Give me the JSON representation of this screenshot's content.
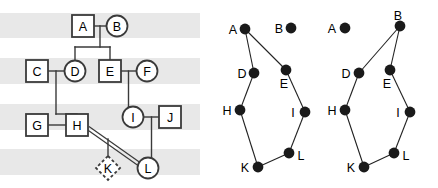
{
  "figure": {
    "panels": [
      "pedigree",
      "graph-middle",
      "graph-right"
    ]
  },
  "colors": {
    "band": "#e8e8e8",
    "background": "#ffffff",
    "stroke": "#3a3a3a",
    "node_fill": "#1a1a1a",
    "shape_fill": "#ffffff",
    "label": "#000000"
  },
  "pedigree": {
    "bands": [
      {
        "name": "generation-band-1",
        "y": 13,
        "height": 25
      },
      {
        "name": "generation-band-2",
        "y": 58,
        "height": 26
      },
      {
        "name": "generation-band-3",
        "y": 104,
        "height": 26
      },
      {
        "name": "generation-band-4",
        "y": 149,
        "height": 26
      }
    ],
    "individuals": [
      {
        "id": "A",
        "label": "A",
        "shape": "square",
        "x": 83,
        "y": 26
      },
      {
        "id": "B",
        "label": "B",
        "shape": "circle",
        "x": 117,
        "y": 26
      },
      {
        "id": "C",
        "label": "C",
        "shape": "square",
        "x": 37,
        "y": 71
      },
      {
        "id": "D",
        "label": "D",
        "shape": "circle",
        "x": 75,
        "y": 71
      },
      {
        "id": "E",
        "label": "E",
        "shape": "square",
        "x": 110,
        "y": 71
      },
      {
        "id": "F",
        "label": "F",
        "shape": "circle",
        "x": 147,
        "y": 71
      },
      {
        "id": "G",
        "label": "G",
        "shape": "square",
        "x": 37,
        "y": 125
      },
      {
        "id": "H",
        "label": "H",
        "shape": "square",
        "x": 77,
        "y": 125
      },
      {
        "id": "I",
        "label": "I",
        "shape": "circle",
        "x": 133,
        "y": 117
      },
      {
        "id": "J",
        "label": "J",
        "shape": "square",
        "x": 170,
        "y": 117
      },
      {
        "id": "K",
        "label": "K",
        "shape": "diamond-dashed",
        "x": 108,
        "y": 168
      },
      {
        "id": "L",
        "label": "L",
        "shape": "circle",
        "x": 148,
        "y": 168
      }
    ],
    "relationships": [
      {
        "name": "mating-A-B",
        "type": "mating",
        "from": "A",
        "to": "B"
      },
      {
        "name": "mating-C-D",
        "type": "mating",
        "from": "C",
        "to": "D"
      },
      {
        "name": "mating-E-F",
        "type": "mating",
        "from": "E",
        "to": "F"
      },
      {
        "name": "mating-G-H",
        "type": "mating",
        "from": "G",
        "to": "H"
      },
      {
        "name": "mating-I-J",
        "type": "mating",
        "from": "I",
        "to": "J"
      },
      {
        "name": "mating-H-L-consanguineous",
        "type": "consanguineous",
        "from": "H",
        "to": "L"
      },
      {
        "name": "descent-AB-to-D",
        "type": "descent",
        "from": "A-B",
        "to": "D"
      },
      {
        "name": "descent-AB-to-E",
        "type": "descent",
        "from": "A-B",
        "to": "E"
      },
      {
        "name": "descent-CD-to-H",
        "type": "descent",
        "from": "C-D",
        "to": "H"
      },
      {
        "name": "descent-EF-to-I",
        "type": "descent",
        "from": "E-F",
        "to": "I"
      },
      {
        "name": "descent-IJ-to-L",
        "type": "descent",
        "from": "I-J",
        "to": "L"
      },
      {
        "name": "descent-HL-to-K",
        "type": "descent",
        "from": "H-L",
        "to": "K"
      }
    ]
  },
  "graph_middle": {
    "caption": "",
    "nodes": [
      {
        "id": "A",
        "label": "A",
        "x": 45,
        "y": 29,
        "label_dx": -12,
        "label_dy": 1
      },
      {
        "id": "B",
        "label": "B",
        "x": 91,
        "y": 28,
        "label_dx": -12,
        "label_dy": 1
      },
      {
        "id": "D",
        "label": "D",
        "x": 54,
        "y": 73,
        "label_dx": -12,
        "label_dy": 1
      },
      {
        "id": "E",
        "label": "E",
        "x": 86,
        "y": 70,
        "label_dx": -2,
        "label_dy": 14
      },
      {
        "id": "H",
        "label": "H",
        "x": 40,
        "y": 110,
        "label_dx": -13,
        "label_dy": 1
      },
      {
        "id": "I",
        "label": "I",
        "x": 105,
        "y": 112,
        "label_dx": -12,
        "label_dy": 1
      },
      {
        "id": "K",
        "label": "K",
        "x": 58,
        "y": 167,
        "label_dx": -13,
        "label_dy": 1
      },
      {
        "id": "L",
        "label": "L",
        "x": 89,
        "y": 153,
        "label_dx": 12,
        "label_dy": 3
      }
    ],
    "edges": [
      {
        "name": "edge-A-D",
        "from": "A",
        "to": "D"
      },
      {
        "name": "edge-A-E",
        "from": "A",
        "to": "E"
      },
      {
        "name": "edge-D-H",
        "from": "D",
        "to": "H"
      },
      {
        "name": "edge-E-I",
        "from": "E",
        "to": "I"
      },
      {
        "name": "edge-H-K",
        "from": "H",
        "to": "K"
      },
      {
        "name": "edge-I-L",
        "from": "I",
        "to": "L"
      },
      {
        "name": "edge-K-L",
        "from": "K",
        "to": "L"
      }
    ],
    "isolated_nodes": [
      "B"
    ]
  },
  "graph_right": {
    "caption": "",
    "nodes": [
      {
        "id": "A",
        "label": "A",
        "x": 27,
        "y": 28,
        "label_dx": -13,
        "label_dy": 1
      },
      {
        "id": "B",
        "label": "B",
        "x": 82,
        "y": 26,
        "label_dx": -2,
        "label_dy": -10
      },
      {
        "id": "D",
        "label": "D",
        "x": 41,
        "y": 73,
        "label_dx": -13,
        "label_dy": 1
      },
      {
        "id": "E",
        "label": "E",
        "x": 72,
        "y": 70,
        "label_dx": -3,
        "label_dy": 14
      },
      {
        "id": "H",
        "label": "H",
        "x": 27,
        "y": 110,
        "label_dx": -13,
        "label_dy": 1
      },
      {
        "id": "I",
        "label": "I",
        "x": 92,
        "y": 112,
        "label_dx": -12,
        "label_dy": 1
      },
      {
        "id": "K",
        "label": "K",
        "x": 46,
        "y": 167,
        "label_dx": -13,
        "label_dy": 1
      },
      {
        "id": "L",
        "label": "L",
        "x": 76,
        "y": 153,
        "label_dx": 12,
        "label_dy": 3
      }
    ],
    "edges": [
      {
        "name": "edge-B-D",
        "from": "B",
        "to": "D"
      },
      {
        "name": "edge-B-E",
        "from": "B",
        "to": "E"
      },
      {
        "name": "edge-D-H",
        "from": "D",
        "to": "H"
      },
      {
        "name": "edge-E-I",
        "from": "E",
        "to": "I"
      },
      {
        "name": "edge-H-K",
        "from": "H",
        "to": "K"
      },
      {
        "name": "edge-I-L",
        "from": "I",
        "to": "L"
      },
      {
        "name": "edge-K-L",
        "from": "K",
        "to": "L"
      }
    ],
    "isolated_nodes": [
      "A"
    ]
  }
}
